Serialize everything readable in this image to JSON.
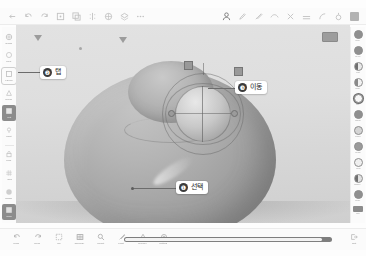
{
  "app": {
    "title": "3D Sculpting App",
    "canvas_background": "#dedede",
    "model_color": "#a2a2a2",
    "accent_color": "#3b3b3b"
  },
  "top_toolbar": {
    "left_items": [
      {
        "name": "back-icon",
        "label": "Back"
      },
      {
        "name": "undo-icon",
        "label": "Undo"
      },
      {
        "name": "redo-icon",
        "label": "Redo"
      },
      {
        "name": "transform-icon",
        "label": "Transform"
      },
      {
        "name": "duplicate-icon",
        "label": "Duplicate"
      },
      {
        "name": "mirror-icon",
        "label": "Mirror"
      },
      {
        "name": "subdivide-icon",
        "label": "Subdivide"
      },
      {
        "name": "layers-icon",
        "label": "Layers"
      },
      {
        "name": "more-icon",
        "label": "More"
      }
    ],
    "right_items": [
      {
        "name": "mask-icon",
        "label": "Mask"
      },
      {
        "name": "pen-icon",
        "label": "Pen"
      },
      {
        "name": "brush-icon",
        "label": "Brush"
      },
      {
        "name": "smooth-icon",
        "label": "Smooth"
      },
      {
        "name": "pinch-icon",
        "label": "Pinch"
      },
      {
        "name": "flatten-icon",
        "label": "Flatten"
      },
      {
        "name": "crease-icon",
        "label": "Crease"
      },
      {
        "name": "inflate-icon",
        "label": "Inflate"
      },
      {
        "name": "settings-icon",
        "label": "Settings"
      }
    ]
  },
  "left_sidebar": {
    "items": [
      {
        "name": "sidebar-item-gizmo",
        "label": "Gizmo",
        "icon": "gizmo-icon",
        "state": "normal"
      },
      {
        "name": "sidebar-item-primitive",
        "label": "Prim",
        "icon": "primitive-icon",
        "state": "normal"
      },
      {
        "name": "sidebar-item-layers",
        "label": "Layers",
        "icon": "layers-icon",
        "state": "boxed"
      },
      {
        "name": "sidebar-item-merge",
        "label": "Merge",
        "icon": "merge-icon",
        "state": "normal"
      },
      {
        "name": "sidebar-item-material",
        "label": "Mat",
        "icon": "material-icon",
        "state": "active"
      },
      {
        "name": "sidebar-item-light",
        "label": "Light",
        "icon": "light-icon",
        "state": "normal"
      },
      {
        "name": "sidebar-item-lock",
        "label": "Lock",
        "icon": "lock-icon",
        "state": "normal"
      },
      {
        "name": "sidebar-item-grid",
        "label": "Grid",
        "icon": "grid-icon",
        "state": "normal"
      },
      {
        "name": "sidebar-item-shade",
        "label": "Shade",
        "icon": "shade-icon",
        "state": "normal"
      },
      {
        "name": "sidebar-item-color",
        "label": "Color",
        "icon": "color-icon",
        "state": "active"
      }
    ]
  },
  "right_sidebar": {
    "items": [
      {
        "name": "brush-swatch-1",
        "label": "Clay",
        "fill": "#8f8f8f",
        "active": false
      },
      {
        "name": "brush-swatch-2",
        "label": "Move",
        "fill": "#8f8f8f",
        "active": false
      },
      {
        "name": "brush-swatch-3",
        "label": "Flat",
        "fill": "#cfcfcf",
        "active": false
      },
      {
        "name": "brush-swatch-4",
        "label": "Crse",
        "fill": "#e6e6e6",
        "active": false
      },
      {
        "name": "brush-swatch-5",
        "label": "Infl",
        "fill": "#f2f2f2",
        "active": true
      },
      {
        "name": "brush-swatch-6",
        "label": "Smth",
        "fill": "#8f8f8f",
        "active": false
      },
      {
        "name": "brush-swatch-7",
        "label": "Pnch",
        "fill": "#d5d5d5",
        "active": false
      },
      {
        "name": "brush-swatch-8",
        "label": "Mask",
        "fill": "#9a9a9a",
        "active": false
      },
      {
        "name": "brush-swatch-9",
        "label": "Trim",
        "fill": "#e0e0e0",
        "active": false
      },
      {
        "name": "brush-swatch-10",
        "label": "Snake",
        "fill": "#b5b5b5",
        "active": false
      },
      {
        "name": "brush-swatch-11",
        "label": "Tube",
        "fill": "#8f8f8f",
        "active": false
      },
      {
        "name": "brush-swatch-12",
        "label": "Std",
        "fill": "#dedede",
        "active": false
      }
    ]
  },
  "bottom_toolbar": {
    "items": [
      {
        "name": "bottom-item-undo",
        "label": "Undo",
        "icon": "undo-icon"
      },
      {
        "name": "bottom-item-redo",
        "label": "Redo",
        "icon": "redo-icon"
      },
      {
        "name": "bottom-item-select",
        "label": "Sel",
        "icon": "select-icon"
      },
      {
        "name": "bottom-item-topology",
        "label": "Topology",
        "icon": "topology-icon"
      },
      {
        "name": "bottom-item-sculpt",
        "label": "Sculpt",
        "icon": "sculpt-icon"
      },
      {
        "name": "bottom-item-paint",
        "label": "Paint",
        "icon": "paint-icon"
      },
      {
        "name": "bottom-item-render",
        "label": "Render",
        "icon": "render-icon"
      },
      {
        "name": "bottom-item-setting",
        "label": "Setting",
        "icon": "gear-icon"
      }
    ],
    "slider": {
      "name": "brush-size-slider",
      "value": 95
    },
    "right_item": {
      "name": "bottom-item-exit",
      "label": "Exit",
      "icon": "exit-icon"
    }
  },
  "callouts": [
    {
      "name": "callout-select",
      "number": "❶",
      "label": "선택"
    },
    {
      "name": "callout-tap",
      "number": "❷",
      "label": "탭"
    },
    {
      "name": "callout-move",
      "number": "❸",
      "label": "이동"
    }
  ],
  "canvas": {
    "gizmo": {
      "name": "transform-gizmo",
      "label": "Transform Gizmo"
    },
    "model": {
      "name": "sculpt-model",
      "label": "3D Character Mesh"
    },
    "corner_widget": {
      "name": "view-cube",
      "label": "View"
    }
  }
}
